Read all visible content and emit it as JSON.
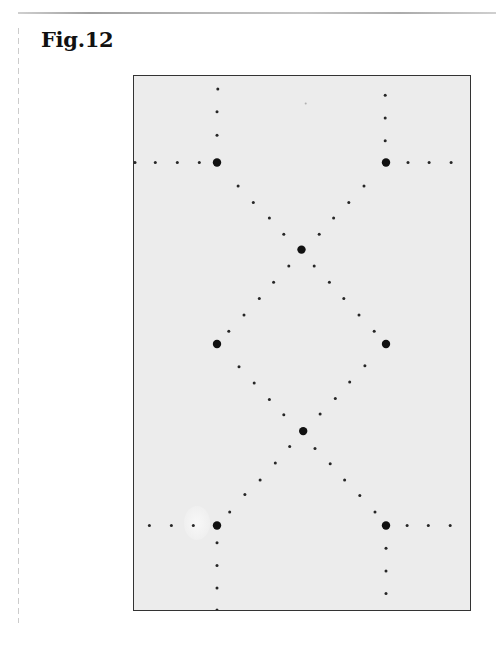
{
  "figure": {
    "label": "Fig.12",
    "colors": {
      "spot": "#111111",
      "plate": "#ececec",
      "border": "#333333"
    }
  },
  "chart_data": {
    "type": "scatter",
    "title": "Fig.12",
    "xlabel": "",
    "ylabel": "",
    "units": "lattice units (large reflections at u = ±1; rows spaced 1 unit in v)",
    "xlim": [
      -2.0,
      2.0
    ],
    "ylim": [
      -3.0,
      3.0
    ],
    "grid": false,
    "series": [
      {
        "name": "large spots",
        "points": [
          [
            -1.0,
            2.0
          ],
          [
            1.0,
            2.0
          ],
          [
            0.0,
            1.04
          ],
          [
            -1.0,
            0.0
          ],
          [
            1.0,
            0.0
          ],
          [
            0.02,
            -0.96
          ],
          [
            -1.0,
            -2.0
          ],
          [
            1.0,
            -2.0
          ]
        ]
      },
      {
        "name": "small spots",
        "points": [
          [
            -0.99,
            2.81
          ],
          [
            -1.0,
            2.56
          ],
          [
            -1.0,
            2.3
          ],
          [
            0.99,
            2.74
          ],
          [
            0.99,
            2.49
          ],
          [
            0.99,
            2.24
          ],
          [
            -1.97,
            2.0
          ],
          [
            -1.73,
            2.0
          ],
          [
            -1.47,
            2.0
          ],
          [
            -1.21,
            2.0
          ],
          [
            1.26,
            2.0
          ],
          [
            1.51,
            2.0
          ],
          [
            1.77,
            2.0
          ],
          [
            -0.75,
            1.74
          ],
          [
            -0.57,
            1.56
          ],
          [
            -0.38,
            1.39
          ],
          [
            -0.21,
            1.21
          ],
          [
            0.74,
            1.74
          ],
          [
            0.56,
            1.56
          ],
          [
            0.38,
            1.39
          ],
          [
            0.21,
            1.21
          ],
          [
            -0.15,
            0.86
          ],
          [
            -0.33,
            0.68
          ],
          [
            -0.5,
            0.5
          ],
          [
            -0.68,
            0.32
          ],
          [
            -0.86,
            0.14
          ],
          [
            0.15,
            0.86
          ],
          [
            0.33,
            0.68
          ],
          [
            0.5,
            0.5
          ],
          [
            0.68,
            0.32
          ],
          [
            0.86,
            0.14
          ],
          [
            -0.74,
            -0.25
          ],
          [
            -0.56,
            -0.43
          ],
          [
            -0.38,
            -0.61
          ],
          [
            -0.21,
            -0.78
          ],
          [
            0.75,
            -0.24
          ],
          [
            0.57,
            -0.42
          ],
          [
            0.4,
            -0.6
          ],
          [
            0.22,
            -0.77
          ],
          [
            -0.14,
            -1.13
          ],
          [
            -0.31,
            -1.31
          ],
          [
            -0.49,
            -1.5
          ],
          [
            -0.67,
            -1.66
          ],
          [
            -0.85,
            -1.85
          ],
          [
            0.16,
            -1.15
          ],
          [
            0.34,
            -1.32
          ],
          [
            0.51,
            -1.5
          ],
          [
            0.69,
            -1.67
          ],
          [
            0.87,
            -1.85
          ],
          [
            -1.8,
            -2.0
          ],
          [
            -1.54,
            -2.0
          ],
          [
            -1.28,
            -2.0
          ],
          [
            1.25,
            -2.0
          ],
          [
            1.5,
            -2.0
          ],
          [
            1.76,
            -2.0
          ],
          [
            -1.0,
            -2.19
          ],
          [
            -1.0,
            -2.44
          ],
          [
            -1.0,
            -2.69
          ],
          [
            -1.0,
            -2.93
          ],
          [
            1.0,
            -2.25
          ],
          [
            1.0,
            -2.5
          ],
          [
            1.0,
            -2.75
          ]
        ]
      },
      {
        "name": "faint spots",
        "points": [
          [
            0.05,
            2.65
          ]
        ]
      }
    ]
  }
}
